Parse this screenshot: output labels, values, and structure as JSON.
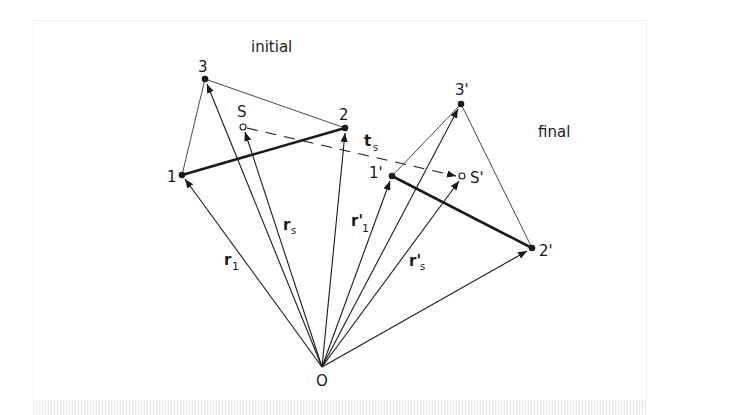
{
  "diagram": {
    "title_initial": "initial",
    "title_final": "final",
    "origin": {
      "label": "O",
      "x": 322,
      "y": 367
    },
    "initial_points": [
      {
        "id": "1",
        "label": "1",
        "x": 182,
        "y": 175
      },
      {
        "id": "2",
        "label": "2",
        "x": 345,
        "y": 128
      },
      {
        "id": "3",
        "label": "3",
        "x": 205,
        "y": 79
      },
      {
        "id": "S",
        "label": "S",
        "x": 243,
        "y": 127
      }
    ],
    "final_points": [
      {
        "id": "1p",
        "label": "1'",
        "x": 392,
        "y": 176
      },
      {
        "id": "2p",
        "label": "2'",
        "x": 532,
        "y": 248
      },
      {
        "id": "3p",
        "label": "3'",
        "x": 461,
        "y": 104
      },
      {
        "id": "Sp",
        "label": "S'",
        "x": 462,
        "y": 176
      }
    ],
    "vector_labels": {
      "r1": {
        "main": "r",
        "sub": "1"
      },
      "rs": {
        "main": "r",
        "sub": "s"
      },
      "r1p": {
        "main": "r'",
        "sub": "1"
      },
      "rsp": {
        "main": "r'",
        "sub": "s"
      },
      "ts": {
        "main": "t",
        "sub": "s"
      }
    },
    "colors": {
      "stroke": "#1a1a1a",
      "background": "#ffffff"
    }
  }
}
